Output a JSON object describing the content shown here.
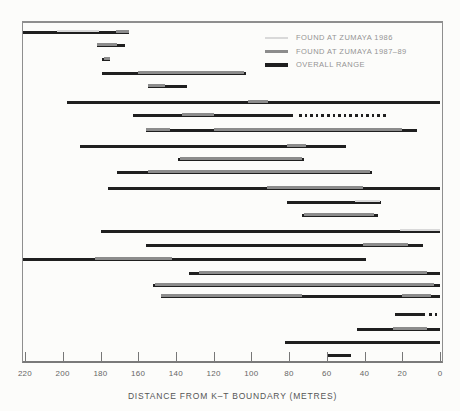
{
  "figure": {
    "background": "#fcfcfa",
    "border_color": "#8e8e8e"
  },
  "chart_data": {
    "type": "bar",
    "subtype": "horizontal-stratigraphic-range-chart",
    "title": "",
    "xlabel": "DISTANCE FROM K–T BOUNDARY (METRES)",
    "ylabel": "",
    "x_axis": {
      "min": 0,
      "max": 220,
      "reversed": true,
      "ticks": [
        220,
        200,
        180,
        160,
        140,
        120,
        100,
        80,
        60,
        40,
        20,
        0
      ],
      "grid": false
    },
    "legend_position": "top-right-inside",
    "legend": [
      {
        "key": "zumaya86",
        "label": "FOUND AT ZUMAYA 1986",
        "color": "#d9d9d9"
      },
      {
        "key": "zumaya87",
        "label": "FOUND AT ZUMAYA 1987–89",
        "color": "#8c8c8c"
      },
      {
        "key": "overall",
        "label": "OVERALL RANGE",
        "color": "#1f1f1f"
      }
    ],
    "units": "metres below K–T boundary (left = 220 m, right = 0 m); each row is one taxon range",
    "rows": [
      {
        "y": 31,
        "segments": [
          {
            "k": "overall",
            "a": 221,
            "b": 165
          },
          {
            "k": "zumaya86",
            "a": 203,
            "b": 181
          },
          {
            "k": "zumaya87",
            "a": 172,
            "b": 165
          }
        ]
      },
      {
        "y": 44,
        "segments": [
          {
            "k": "overall",
            "a": 182,
            "b": 167
          },
          {
            "k": "zumaya87",
            "a": 182,
            "b": 171
          }
        ]
      },
      {
        "y": 58,
        "segments": [
          {
            "k": "overall",
            "a": 179,
            "b": 175
          },
          {
            "k": "zumaya87",
            "a": 178,
            "b": 175
          }
        ]
      },
      {
        "y": 72,
        "segments": [
          {
            "k": "overall",
            "a": 179,
            "b": 103
          },
          {
            "k": "zumaya87",
            "a": 160,
            "b": 104
          }
        ]
      },
      {
        "y": 85,
        "segments": [
          {
            "k": "overall",
            "a": 155,
            "b": 134
          },
          {
            "k": "zumaya87",
            "a": 155,
            "b": 146
          }
        ]
      },
      {
        "y": 101,
        "segments": [
          {
            "k": "overall",
            "a": 198,
            "b": 0
          },
          {
            "k": "zumaya87",
            "a": 102,
            "b": 91
          }
        ]
      },
      {
        "y": 114,
        "segments": [
          {
            "k": "overall",
            "a": 163,
            "b": 78
          },
          {
            "k": "zumaya87",
            "a": 137,
            "b": 120
          },
          {
            "k": "dots",
            "a": 75,
            "b": 28
          }
        ]
      },
      {
        "y": 129,
        "segments": [
          {
            "k": "overall",
            "a": 156,
            "b": 12
          },
          {
            "k": "zumaya87",
            "a": 156,
            "b": 143
          },
          {
            "k": "zumaya87",
            "a": 120,
            "b": 20
          }
        ]
      },
      {
        "y": 145,
        "segments": [
          {
            "k": "overall",
            "a": 191,
            "b": 50
          },
          {
            "k": "zumaya87",
            "a": 81,
            "b": 71
          }
        ]
      },
      {
        "y": 158,
        "segments": [
          {
            "k": "overall",
            "a": 139,
            "b": 72
          },
          {
            "k": "zumaya87",
            "a": 138,
            "b": 73
          }
        ]
      },
      {
        "y": 171,
        "segments": [
          {
            "k": "overall",
            "a": 171,
            "b": 36
          },
          {
            "k": "zumaya87",
            "a": 155,
            "b": 37
          }
        ]
      },
      {
        "y": 187,
        "segments": [
          {
            "k": "overall",
            "a": 176,
            "b": 0
          },
          {
            "k": "zumaya87",
            "a": 92,
            "b": 41
          }
        ]
      },
      {
        "y": 201,
        "segments": [
          {
            "k": "overall",
            "a": 81,
            "b": 31
          },
          {
            "k": "zumaya86",
            "a": 45,
            "b": 32
          }
        ]
      },
      {
        "y": 214,
        "segments": [
          {
            "k": "overall",
            "a": 73,
            "b": 33
          },
          {
            "k": "zumaya87",
            "a": 72,
            "b": 35
          }
        ]
      },
      {
        "y": 230,
        "segments": [
          {
            "k": "overall",
            "a": 180,
            "b": 0
          },
          {
            "k": "zumaya86",
            "a": 21,
            "b": 0
          }
        ]
      },
      {
        "y": 244,
        "segments": [
          {
            "k": "overall",
            "a": 156,
            "b": 9
          },
          {
            "k": "zumaya87",
            "a": 41,
            "b": 17
          }
        ]
      },
      {
        "y": 258,
        "segments": [
          {
            "k": "overall",
            "a": 221,
            "b": 39
          },
          {
            "k": "zumaya87",
            "a": 183,
            "b": 142
          }
        ]
      },
      {
        "y": 272,
        "segments": [
          {
            "k": "overall",
            "a": 133,
            "b": 0
          },
          {
            "k": "zumaya87",
            "a": 128,
            "b": 7
          }
        ]
      },
      {
        "y": 284,
        "segments": [
          {
            "k": "overall",
            "a": 152,
            "b": 0
          },
          {
            "k": "zumaya87",
            "a": 151,
            "b": 3
          }
        ]
      },
      {
        "y": 295,
        "segments": [
          {
            "k": "overall",
            "a": 148,
            "b": 0
          },
          {
            "k": "zumaya87",
            "a": 148,
            "b": 73
          },
          {
            "k": "zumaya87",
            "a": 20,
            "b": 5
          }
        ]
      },
      {
        "y": 313,
        "segments": [
          {
            "k": "overall",
            "a": 24,
            "b": 8
          },
          {
            "k": "dots",
            "a": 6,
            "b": 0
          }
        ]
      },
      {
        "y": 328,
        "segments": [
          {
            "k": "overall",
            "a": 44,
            "b": 0
          },
          {
            "k": "zumaya87",
            "a": 25,
            "b": 7
          }
        ]
      },
      {
        "y": 341,
        "segments": [
          {
            "k": "overall",
            "a": 82,
            "b": 0
          }
        ]
      },
      {
        "y": 354,
        "segments": [
          {
            "k": "overall",
            "a": 60,
            "b": 47
          }
        ]
      }
    ]
  }
}
